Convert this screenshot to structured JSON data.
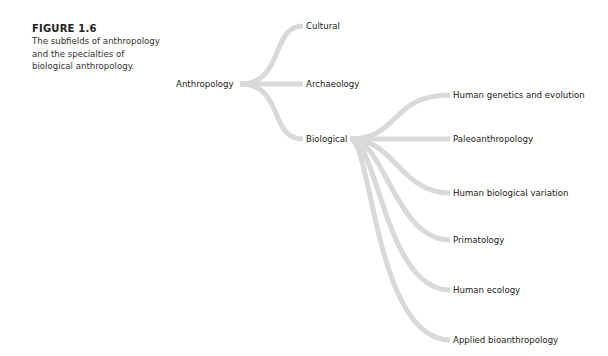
{
  "caption": {
    "title": "FIGURE 1.6",
    "text": "The subfields of anthropology and the specialties of biological anthropology."
  },
  "line_color": "#d9d9d9",
  "tree": {
    "root": "Anthropology",
    "subfields": [
      "Cultural",
      "Archaeology",
      "Biological"
    ],
    "biological_specialties": [
      "Human genetics and evolution",
      "Paleoanthropology",
      "Human biological variation",
      "Primatology",
      "Human ecology",
      "Applied bioanthropology"
    ]
  }
}
